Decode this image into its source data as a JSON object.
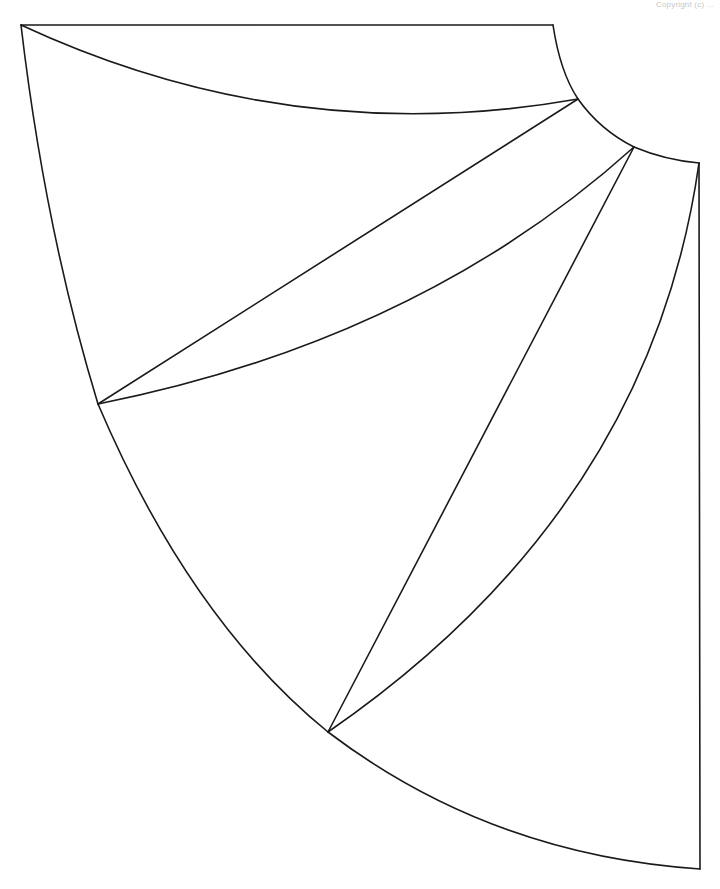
{
  "copyright": "Copyright (c) ...",
  "diagram": {
    "type": "pattern-piece",
    "stroke_color": "#1a1a1a",
    "background": "#ffffff",
    "points": {
      "top_left": [
        21,
        25
      ],
      "inner_arc_start": [
        553,
        25
      ],
      "inner_p1": [
        578,
        99
      ],
      "inner_p2": [
        634,
        147
      ],
      "inner_arc_end": [
        699,
        163
      ],
      "outer_p1": [
        98,
        404
      ],
      "outer_p2": [
        328,
        732
      ],
      "bottom_right": [
        700,
        869
      ]
    }
  }
}
